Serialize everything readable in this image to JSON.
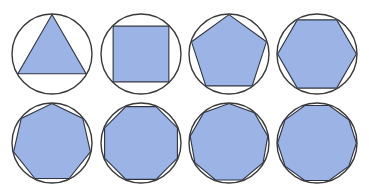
{
  "figure": {
    "fill_color": "#9cb3e6",
    "stroke_color": "#3a3a3a",
    "background": "#ffffff"
  },
  "shapes": [
    {
      "name": "triangle",
      "sides": 3,
      "cx": 52,
      "cy": 54,
      "r": 40,
      "rotation_deg": 0
    },
    {
      "name": "square",
      "sides": 4,
      "cx": 141,
      "cy": 54,
      "r": 40,
      "rotation_deg": 45
    },
    {
      "name": "pentagon",
      "sides": 5,
      "cx": 229,
      "cy": 54,
      "r": 40,
      "rotation_deg": 0
    },
    {
      "name": "hexagon",
      "sides": 6,
      "cx": 317,
      "cy": 54,
      "r": 40,
      "rotation_deg": 30
    },
    {
      "name": "heptagon",
      "sides": 7,
      "cx": 52,
      "cy": 143,
      "r": 40,
      "rotation_deg": 0
    },
    {
      "name": "octagon",
      "sides": 8,
      "cx": 141,
      "cy": 143,
      "r": 40,
      "rotation_deg": 22.5
    },
    {
      "name": "nonagon",
      "sides": 9,
      "cx": 229,
      "cy": 143,
      "r": 40,
      "rotation_deg": 0
    },
    {
      "name": "decagon",
      "sides": 10,
      "cx": 317,
      "cy": 143,
      "r": 40,
      "rotation_deg": 18
    }
  ]
}
